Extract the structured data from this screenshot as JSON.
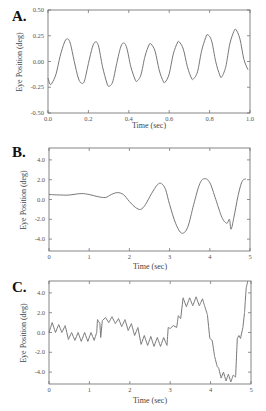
{
  "chart_data": [
    {
      "panel": "A.",
      "type": "line",
      "xlabel": "Time (sec)",
      "ylabel": "Eye Position (deg)",
      "xlim": [
        0.0,
        1.0
      ],
      "ylim": [
        -0.5,
        0.5
      ],
      "xticks": [
        "0.0",
        "0.2",
        "0.4",
        "0.6",
        "0.8",
        "1.0"
      ],
      "yticks": [
        "0.50",
        "0.25",
        "0.00",
        "-0.25",
        "-0.50"
      ],
      "grid": false,
      "description": "Sinusoidal oscillation ~7 Hz, amplitude ~0.2 deg, growing slightly toward end",
      "x": [
        0.0,
        0.01,
        0.02,
        0.04,
        0.06,
        0.08,
        0.095,
        0.11,
        0.13,
        0.15,
        0.165,
        0.18,
        0.2,
        0.22,
        0.235,
        0.25,
        0.27,
        0.29,
        0.3,
        0.32,
        0.34,
        0.36,
        0.375,
        0.39,
        0.41,
        0.43,
        0.44,
        0.46,
        0.48,
        0.5,
        0.51,
        0.53,
        0.55,
        0.57,
        0.58,
        0.6,
        0.62,
        0.64,
        0.65,
        0.67,
        0.69,
        0.71,
        0.72,
        0.74,
        0.76,
        0.78,
        0.79,
        0.81,
        0.83,
        0.85,
        0.86,
        0.88,
        0.9,
        0.92,
        0.93,
        0.95,
        0.97,
        0.99
      ],
      "y": [
        -0.16,
        -0.22,
        -0.21,
        -0.12,
        0.05,
        0.18,
        0.22,
        0.18,
        0.0,
        -0.16,
        -0.21,
        -0.19,
        -0.02,
        0.14,
        0.19,
        0.15,
        -0.05,
        -0.2,
        -0.24,
        -0.2,
        -0.02,
        0.14,
        0.18,
        0.13,
        -0.05,
        -0.17,
        -0.19,
        -0.13,
        0.05,
        0.16,
        0.17,
        0.1,
        -0.08,
        -0.19,
        -0.2,
        -0.12,
        0.07,
        0.18,
        0.19,
        0.12,
        -0.05,
        -0.16,
        -0.17,
        -0.1,
        0.1,
        0.23,
        0.26,
        0.2,
        0.0,
        -0.13,
        -0.15,
        -0.05,
        0.17,
        0.29,
        0.31,
        0.22,
        0.02,
        -0.08
      ]
    },
    {
      "panel": "B.",
      "type": "line",
      "xlabel": "Time (sec)",
      "ylabel": "Eye Position (deg)",
      "xlim": [
        0,
        5
      ],
      "ylim": [
        -5.2,
        5.2
      ],
      "xticks": [
        "0",
        "1",
        "2",
        "3",
        "4",
        "5"
      ],
      "yticks": [
        "4.0",
        "2.0",
        "0.0",
        "-2.0",
        "-4.0"
      ],
      "grid": false,
      "description": "Flat near 0.5 deg until ~1.8 s, then growing oscillation ~1 Hz reaching +/-3 deg",
      "x": [
        0.0,
        0.3,
        0.5,
        0.8,
        1.0,
        1.2,
        1.4,
        1.55,
        1.7,
        1.85,
        2.0,
        2.15,
        2.28,
        2.4,
        2.55,
        2.7,
        2.8,
        2.9,
        3.0,
        3.15,
        3.3,
        3.45,
        3.6,
        3.75,
        3.87,
        4.0,
        4.15,
        4.3,
        4.42,
        4.48,
        4.5,
        4.53,
        4.6,
        4.7,
        4.8,
        4.9
      ],
      "y": [
        0.5,
        0.45,
        0.45,
        0.6,
        0.5,
        0.3,
        0.2,
        0.5,
        0.7,
        0.5,
        -0.2,
        -0.8,
        -1.0,
        -0.5,
        0.6,
        1.5,
        1.6,
        1.0,
        -0.5,
        -2.4,
        -3.4,
        -2.8,
        -0.5,
        1.6,
        2.1,
        1.7,
        0.0,
        -1.8,
        -2.4,
        -2.0,
        -2.2,
        -3.0,
        -1.8,
        0.3,
        1.8,
        2.1
      ]
    },
    {
      "panel": "C.",
      "type": "line",
      "xlabel": "Time (sec)",
      "ylabel": "Eye Position (deg)",
      "xlim": [
        0,
        5
      ],
      "ylim": [
        -5.2,
        5.2
      ],
      "xticks": [
        "0",
        "1",
        "2",
        "3",
        "4",
        "5"
      ],
      "yticks": [
        "4.0",
        "2.0",
        "0.0",
        "-2.0",
        "-4.0"
      ],
      "grid": false,
      "description": "High-frequency (~6 Hz) small oscillations superimposed on step-like slow drifts; saccade-like jumps near 1.2 s, 2.95 s, 3.3 s; large excursion to -5 deg near 4.5 s then rapid rise past +5 deg at 4.9 s",
      "x": [
        0.0,
        0.08,
        0.16,
        0.24,
        0.32,
        0.4,
        0.48,
        0.56,
        0.64,
        0.72,
        0.8,
        0.88,
        0.96,
        1.04,
        1.12,
        1.18,
        1.2,
        1.26,
        1.28,
        1.32,
        1.4,
        1.48,
        1.56,
        1.64,
        1.72,
        1.8,
        1.88,
        1.96,
        2.04,
        2.12,
        2.2,
        2.28,
        2.36,
        2.44,
        2.52,
        2.6,
        2.68,
        2.76,
        2.84,
        2.92,
        2.95,
        3.0,
        3.08,
        3.16,
        3.2,
        3.26,
        3.32,
        3.4,
        3.48,
        3.56,
        3.64,
        3.72,
        3.8,
        3.86,
        3.92,
        3.98,
        4.04,
        4.1,
        4.16,
        4.2,
        4.26,
        4.32,
        4.38,
        4.44,
        4.5,
        4.56,
        4.62,
        4.66,
        4.7,
        4.74,
        4.8,
        4.84,
        4.88,
        4.92
      ],
      "y": [
        0.0,
        1.0,
        0.0,
        0.8,
        0.0,
        0.7,
        -0.7,
        0.0,
        -0.8,
        0.0,
        -0.9,
        0.0,
        -0.9,
        0.0,
        -0.8,
        0.0,
        1.3,
        0.9,
        -0.5,
        1.2,
        1.5,
        1.0,
        1.6,
        0.9,
        1.4,
        0.6,
        1.3,
        0.2,
        0.9,
        -0.3,
        0.5,
        -1.2,
        -0.3,
        -1.3,
        -0.4,
        -1.4,
        -0.5,
        -1.4,
        -0.5,
        -1.3,
        0.5,
        0.4,
        0.7,
        0.5,
        1.7,
        1.4,
        3.5,
        2.6,
        3.5,
        2.7,
        3.6,
        2.7,
        3.4,
        2.6,
        1.8,
        -0.6,
        -0.8,
        -2.4,
        -3.4,
        -3.6,
        -4.6,
        -4.0,
        -4.9,
        -4.2,
        -5.0,
        -4.3,
        -4.5,
        -0.6,
        -0.3,
        -0.6,
        0.5,
        2.0,
        4.5,
        5.4
      ]
    }
  ]
}
